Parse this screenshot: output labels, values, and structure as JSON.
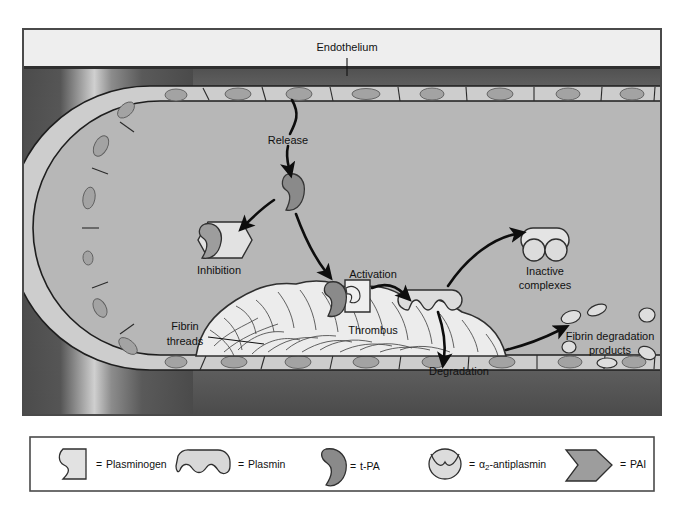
{
  "figure": {
    "type": "biological-diagram"
  },
  "labels": {
    "endothelium": "Endothelium",
    "release": "Release",
    "inhibition": "Inhibition",
    "activation": "Activation",
    "thrombus": "Thrombus",
    "fibrin_threads_line1": "Fibrin",
    "fibrin_threads_line2": "threads",
    "degradation": "Degradation",
    "inactive_line1": "Inactive",
    "inactive_line2": "complexes",
    "fdp_line1": "Fibrin degradation",
    "fdp_line2": "products"
  },
  "legend": {
    "items": [
      {
        "key": "plasminogen",
        "shape": "notched-rectangle",
        "equals": "=",
        "label": "Plasminogen"
      },
      {
        "key": "plasmin",
        "shape": "double-notched-dome",
        "equals": "=",
        "label": "Plasmin"
      },
      {
        "key": "tpa",
        "shape": "kidney",
        "equals": "=",
        "label": "t-PA"
      },
      {
        "key": "a2antiplasmin",
        "shape": "v-notched-circle",
        "equals": "=",
        "label": "α2-antiplasmin",
        "label_base": "α",
        "label_sub": "2",
        "label_rest": "-antiplasmin"
      },
      {
        "key": "pai",
        "shape": "hexagon-arrow",
        "equals": "=",
        "label": "PAI"
      }
    ]
  },
  "colors": {
    "page_background": "#ffffff",
    "frame_stroke": "#4a4a4a",
    "vessel_exterior_dark": "#4f4f4f",
    "vessel_exterior_highlight": "#c8c8c8",
    "lumen": "#b7b7b7",
    "endothelial_cell": "#cdcdcd",
    "endothelial_nucleus": "#a3a3a3",
    "thrombus_fill": "#ececec",
    "thrombus_stroke": "#3a3a3a",
    "tpa_dark": "#8a8a8a",
    "plasminogen_light": "#e8e8e8",
    "plasmin_light": "#d8d8d8",
    "antiplasmin_light": "#dcdcdc",
    "pai_grey": "#9d9d9d",
    "arrow_black": "#0d0d0d",
    "text": "#111111"
  },
  "arrows": [
    {
      "name": "release-arrow",
      "from": "endothelium",
      "to": "t-PA"
    },
    {
      "name": "inhibition-arrow",
      "from": "t-PA",
      "to": "PAI complex"
    },
    {
      "name": "activation-arrow-in",
      "from": "t-PA",
      "to": "thrombus-bound plasminogen"
    },
    {
      "name": "activation-arrow",
      "from": "plasminogen",
      "to": "plasmin"
    },
    {
      "name": "inactivation-arrow",
      "from": "plasmin",
      "to": "inactive complexes"
    },
    {
      "name": "degradation-arrow",
      "from": "plasmin",
      "to": "degradation"
    },
    {
      "name": "fdp-arrow",
      "from": "thrombus",
      "to": "fibrin degradation products"
    }
  ]
}
